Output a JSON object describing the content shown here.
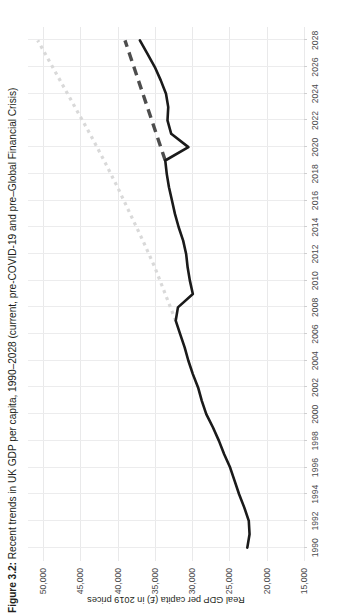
{
  "figure": {
    "number_label": "Figure 3.2:",
    "title_rest": " Recent trends in UK GDP per capita, 1990–2028 (current, pre-COVID-19 and pre–Global Financial Crisis)",
    "full_title": "Figure 3.2: Recent trends in UK GDP per capita, 1990–2028 (current, pre-COVID-19 and pre–Global Financial Crisis)"
  },
  "axes": {
    "y_axis_label": "Real GDP per capita (£) in 2019 prices",
    "y_ticks": [
      "50,000",
      "45,000",
      "40,000",
      "35,000",
      "30,000",
      "25,000",
      "20,000",
      "15,000"
    ],
    "x_ticks": [
      "1990",
      "1992",
      "1994",
      "1996",
      "1998",
      "2000",
      "2002",
      "2004",
      "2006",
      "2008",
      "2010",
      "2012",
      "2014",
      "2016",
      "2018",
      "2020",
      "2022",
      "2024",
      "2026",
      "2028"
    ]
  },
  "colors": {
    "actual_line": "#1a1a1a",
    "pre_covid_trend": "#4d4d4d",
    "pre_gfc_trend": "#d9d9d9",
    "gridline": "#ececed",
    "text": "#231f20",
    "tick_text": "#4b4b4d"
  },
  "chart_data": {
    "type": "line",
    "title": "Figure 3.2: Recent trends in UK GDP per capita, 1990–2028 (current, pre-COVID-19 and pre–Global Financial Crisis)",
    "xlabel": "",
    "ylabel": "Real GDP per capita (£) in 2019 prices",
    "xlim": [
      1989,
      2029
    ],
    "ylim": [
      15000,
      52000
    ],
    "ytick_values": [
      50000,
      45000,
      40000,
      35000,
      30000,
      25000,
      20000,
      15000
    ],
    "xtick_values": [
      1990,
      1992,
      1994,
      1996,
      1998,
      2000,
      2002,
      2004,
      2006,
      2008,
      2010,
      2012,
      2014,
      2016,
      2018,
      2020,
      2022,
      2024,
      2026,
      2028
    ],
    "grid": "horizontal-and-vertical-light",
    "legend": "none",
    "series": [
      {
        "name": "Actual / current real GDP per capita",
        "style": "solid",
        "color": "#1a1a1a",
        "x": [
          1990,
          1991,
          1992,
          1993,
          1994,
          1995,
          1996,
          1997,
          1998,
          1999,
          2000,
          2001,
          2002,
          2003,
          2004,
          2005,
          2006,
          2007,
          2008,
          2009,
          2010,
          2011,
          2012,
          2013,
          2014,
          2015,
          2016,
          2017,
          2018,
          2019,
          2020,
          2021,
          2022,
          2023,
          2024,
          2025,
          2026,
          2027,
          2028
        ],
        "y": [
          22600,
          22300,
          22400,
          23000,
          23700,
          24300,
          24900,
          25700,
          26400,
          27200,
          28100,
          28700,
          29200,
          29900,
          30500,
          31000,
          31600,
          32200,
          31900,
          29900,
          30300,
          30600,
          30800,
          31200,
          31800,
          32300,
          32700,
          33100,
          33400,
          33600,
          30500,
          32800,
          33300,
          33200,
          33500,
          34200,
          35000,
          36000,
          37000
        ]
      },
      {
        "name": "Pre-COVID-19 trend",
        "style": "dashed",
        "color": "#4d4d4d",
        "x": [
          2019,
          2020,
          2021,
          2022,
          2023,
          2024,
          2025,
          2026,
          2027,
          2028
        ],
        "y": [
          33600,
          34200,
          34800,
          35400,
          36000,
          36600,
          37200,
          37800,
          38400,
          39000
        ]
      },
      {
        "name": "Pre–Global Financial Crisis trend",
        "style": "dotted",
        "color": "#d9d9d9",
        "x": [
          2007,
          2009,
          2011,
          2013,
          2015,
          2017,
          2019,
          2021,
          2023,
          2025,
          2027,
          2028
        ],
        "y": [
          32200,
          33600,
          35000,
          36600,
          38300,
          40000,
          41800,
          43700,
          45700,
          47700,
          49700,
          50700
        ]
      }
    ]
  }
}
